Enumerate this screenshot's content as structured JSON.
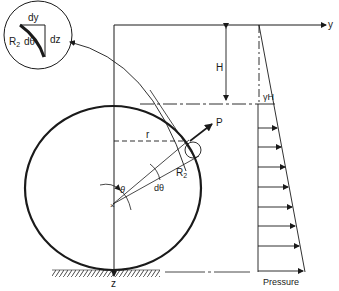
{
  "diagram": {
    "inset": {
      "labels": {
        "dy": "dy",
        "dz": "dz",
        "r2": "R",
        "r2_sub": "2",
        "dtheta": "dθ"
      }
    },
    "axes": {
      "y": "y",
      "z": "z"
    },
    "dimension": {
      "H": "H"
    },
    "vessel": {
      "labels": {
        "r": "r",
        "P": "P",
        "R2": "R",
        "R2_sub": "2",
        "theta": "θ",
        "dtheta": "dθ"
      }
    },
    "pressure": {
      "top_label": "γH",
      "caption": "Pressure"
    },
    "colors": {
      "line": "#1a1a1a",
      "background": "#ffffff"
    }
  }
}
